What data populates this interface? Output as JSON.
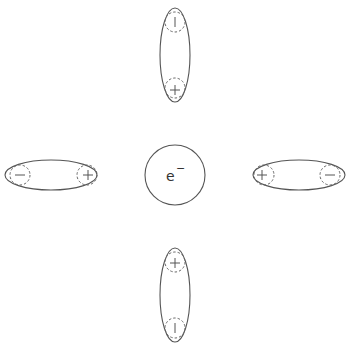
{
  "diagram": {
    "title": "",
    "center": {
      "label": "e",
      "charge": "−",
      "description": "electron"
    },
    "dipoles": [
      {
        "name": "top",
        "orientation": "vertical",
        "end_near_center": "+",
        "end_far": "−"
      },
      {
        "name": "bottom",
        "orientation": "vertical",
        "end_near_center": "+",
        "end_far": "−"
      },
      {
        "name": "left",
        "orientation": "horizontal",
        "end_near_center": "+",
        "end_far": "−"
      },
      {
        "name": "right",
        "orientation": "horizontal",
        "end_near_center": "+",
        "end_far": "−"
      }
    ],
    "colors": {
      "stroke": "#555555",
      "background": "#ffffff"
    }
  }
}
